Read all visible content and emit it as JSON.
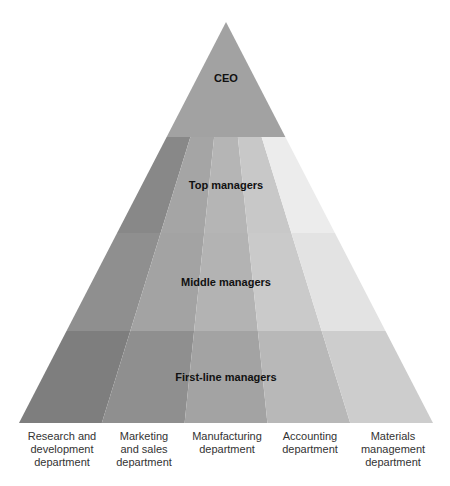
{
  "diagram": {
    "levels": [
      {
        "label": "CEO",
        "color": "#a2a2a2"
      },
      {
        "label": "Top managers",
        "colors": [
          "#888888",
          "#a5a5a5",
          "#b5b5b5",
          "#c8c8c8",
          "#ececec"
        ]
      },
      {
        "label": "Middle managers",
        "colors": [
          "#8f8f8f",
          "#a3a3a3",
          "#b3b3b3",
          "#cacaca",
          "#e3e3e3"
        ]
      },
      {
        "label": "First-line managers",
        "colors": [
          "#7e7e7e",
          "#8f8f8f",
          "#a3a3a3",
          "#b8b8b8",
          "#cdcdcd"
        ]
      }
    ],
    "departments": [
      {
        "line1": "Research and",
        "line2": "development",
        "line3": "department"
      },
      {
        "line1": "Marketing",
        "line2": "and sales",
        "line3": "department"
      },
      {
        "line1": "Manufacturing",
        "line2": "department",
        "line3": ""
      },
      {
        "line1": "Accounting",
        "line2": "department",
        "line3": ""
      },
      {
        "line1": "Materials",
        "line2": "management",
        "line3": "department"
      }
    ]
  }
}
